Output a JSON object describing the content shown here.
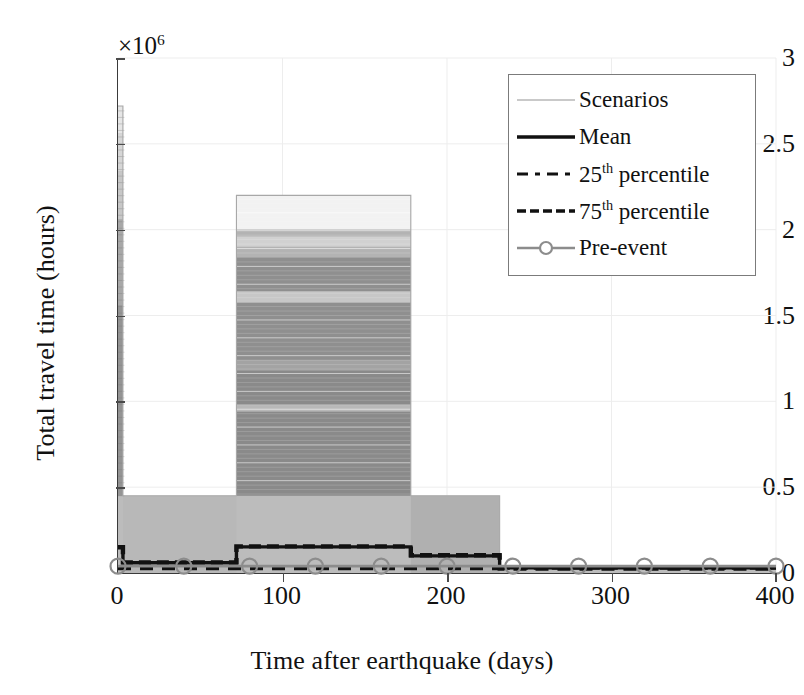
{
  "chart_data": {
    "type": "area",
    "title": "",
    "xlabel": "Time after earthquake (days)",
    "ylabel": "Total travel time (hours)",
    "y_multiplier": "×10",
    "y_multiplier_exponent": "6",
    "xlim": [
      0,
      400
    ],
    "ylim": [
      0,
      3000000
    ],
    "xticks": [
      0,
      100,
      200,
      300,
      400
    ],
    "xtick_labels": [
      "0",
      "100",
      "200",
      "300",
      "400"
    ],
    "yticks": [
      0,
      500000,
      1000000,
      1500000,
      2000000,
      2500000,
      3000000
    ],
    "ytick_labels": [
      "0",
      "0.5",
      "1",
      "1.5",
      "2",
      "2.5",
      "3"
    ],
    "grid": true,
    "grid_color": "#ededed",
    "legend_position": "upper right",
    "series": [
      {
        "name": "Scenarios",
        "style": "scenario-band",
        "color": "#b4b4b4",
        "description": "Many individual recovery scenario traces forming a shaded envelope",
        "envelope_x": [
          0,
          3,
          3,
          72,
          72,
          178,
          178,
          232,
          232,
          400
        ],
        "envelope_y": [
          2720000,
          2720000,
          450000,
          450000,
          2200000,
          2200000,
          450000,
          450000,
          30000,
          30000
        ]
      },
      {
        "name": "Mean",
        "style": "solid",
        "color": "#111111",
        "x": [
          0,
          3,
          3,
          72,
          72,
          178,
          178,
          232,
          232,
          400
        ],
        "y": [
          150000,
          150000,
          60000,
          60000,
          152000,
          152000,
          100000,
          100000,
          30000,
          30000
        ]
      },
      {
        "name": "25th percentile",
        "label_prefix": "25",
        "label_sup": "th",
        "label_suffix": " percentile",
        "style": "dashed",
        "color": "#111111",
        "x": [
          0,
          232,
          232,
          400
        ],
        "y": [
          28000,
          28000,
          25000,
          25000
        ]
      },
      {
        "name": "75th percentile",
        "label_prefix": "75",
        "label_sup": "th",
        "label_suffix": " percentile",
        "style": "dashed-heavy",
        "color": "#111111",
        "x": [
          0,
          3,
          3,
          72,
          72,
          178,
          178,
          232,
          232,
          400
        ],
        "y": [
          150000,
          150000,
          62000,
          62000,
          155000,
          155000,
          103000,
          103000,
          32000,
          32000
        ]
      },
      {
        "name": "Pre-event",
        "style": "line-marker-circle",
        "color": "#8c8c8c",
        "marker_x": [
          0,
          40,
          80,
          120,
          160,
          200,
          240,
          280,
          320,
          360,
          400
        ],
        "y_constant": 40000
      }
    ],
    "scenario_band_rows": [
      {
        "y_top": 2720000,
        "y_bot": 2560000,
        "shade": 0.1
      },
      {
        "y_top": 2560000,
        "y_bot": 2340000,
        "shade": 0.16
      },
      {
        "y_top": 2340000,
        "y_bot": 2060000,
        "shade": 0.22
      },
      {
        "y_top": 2060000,
        "y_bot": 1560000,
        "shade": 0.34
      },
      {
        "y_top": 1560000,
        "y_bot": 450000,
        "shade": 0.42
      }
    ],
    "mid_block_rows": [
      {
        "y_top": 2200000,
        "y_bot": 2000000,
        "shade": 0.05
      },
      {
        "y_top": 2000000,
        "y_bot": 1960000,
        "shade": 0.3
      },
      {
        "y_top": 1960000,
        "y_bot": 1900000,
        "shade": 0.18
      },
      {
        "y_top": 1900000,
        "y_bot": 1840000,
        "shade": 0.3
      },
      {
        "y_top": 1840000,
        "y_bot": 1640000,
        "shade": 0.44
      },
      {
        "y_top": 1640000,
        "y_bot": 1580000,
        "shade": 0.22
      },
      {
        "y_top": 1580000,
        "y_bot": 1240000,
        "shade": 0.44
      },
      {
        "y_top": 1240000,
        "y_bot": 1180000,
        "shade": 0.36
      },
      {
        "y_top": 1180000,
        "y_bot": 980000,
        "shade": 0.46
      },
      {
        "y_top": 980000,
        "y_bot": 940000,
        "shade": 0.28
      },
      {
        "y_top": 940000,
        "y_bot": 450000,
        "shade": 0.46
      }
    ]
  },
  "legend": {
    "title": "",
    "items": [
      {
        "label": "Scenarios",
        "sample": "thin-gray-line"
      },
      {
        "label": "Mean",
        "sample": "solid-black-line"
      },
      {
        "label_prefix": "25",
        "label_sup": "th",
        "label_suffix": " percentile",
        "sample": "dashed-line"
      },
      {
        "label_prefix": "75",
        "label_sup": "th",
        "label_suffix": " percentile",
        "sample": "dashed-heavy-line"
      },
      {
        "label": "Pre-event",
        "sample": "gray-line-circle-marker"
      }
    ]
  },
  "axes": {
    "x_title": "Time after earthquake (days)",
    "y_title": "Total travel time (hours)",
    "exponent_prefix": "×10",
    "exponent_power": "6"
  }
}
